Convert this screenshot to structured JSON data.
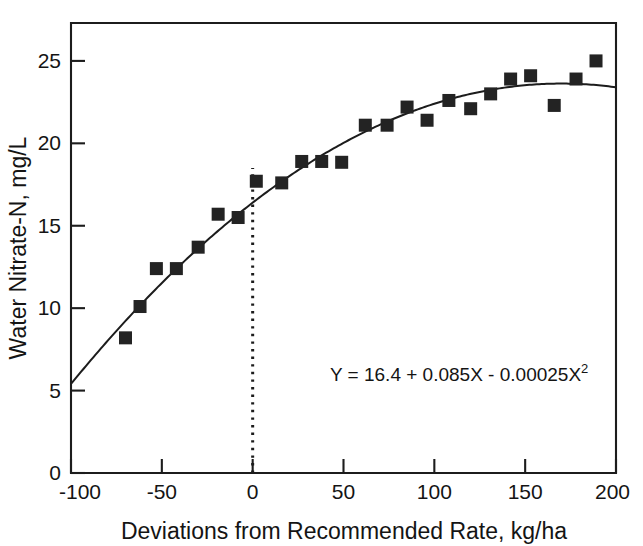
{
  "chart_data": {
    "type": "scatter",
    "title": "",
    "xlabel": "Deviations from Recommended Rate, kg/ha",
    "ylabel": "Water Nitrate-N, mg/L",
    "xlim": [
      -100,
      200
    ],
    "ylim": [
      0,
      27.3
    ],
    "xticks": [
      -100,
      -50,
      0,
      50,
      100,
      150,
      200
    ],
    "yticks": [
      0,
      5,
      10,
      15,
      20,
      25
    ],
    "xtick_labels": [
      "-100",
      "-50",
      "0",
      "50",
      "100",
      "150",
      "200"
    ],
    "ytick_labels": [
      "0",
      "5",
      "10",
      "15",
      "20",
      "25"
    ],
    "grid": false,
    "legend": "none",
    "marker_style": "filled-square",
    "marker_color": "#232323",
    "curve_color": "#1c1c1c",
    "annotations": [
      {
        "name": "regression-equation",
        "text": "Y = 16.4 + 0.085X - 0.00025X",
        "superscript": "2",
        "x": 58,
        "y": 7.2
      }
    ],
    "reference_line": {
      "name": "zero-deviation-line",
      "orientation": "vertical",
      "x": 0,
      "style": "dotted",
      "y_from": 0,
      "y_to": 18.5
    },
    "fit": {
      "equation": "Y = 16.4 + 0.085X - 0.00025X^2",
      "intercept": 16.4,
      "linear_coef": 0.085,
      "quadratic_coef": -0.00025,
      "x_from": -100,
      "x_to": 200
    },
    "x": [
      -70,
      -62,
      -53,
      -42,
      -30,
      -19,
      -8,
      2,
      16,
      27,
      38,
      49,
      62,
      74,
      85,
      96,
      108,
      120,
      131,
      142,
      153,
      166,
      178,
      189
    ],
    "y": [
      8.2,
      10.1,
      12.4,
      12.4,
      13.7,
      15.7,
      15.5,
      17.7,
      17.6,
      18.9,
      18.9,
      18.85,
      21.1,
      21.1,
      22.2,
      21.4,
      22.6,
      22.1,
      23.0,
      23.9,
      24.1,
      22.3,
      23.9,
      25.0
    ],
    "points": [
      {
        "x": -70,
        "y": 8.2
      },
      {
        "x": -62,
        "y": 10.1
      },
      {
        "x": -53,
        "y": 12.4
      },
      {
        "x": -42,
        "y": 12.4
      },
      {
        "x": -30,
        "y": 13.7
      },
      {
        "x": -19,
        "y": 15.7
      },
      {
        "x": -8,
        "y": 15.5
      },
      {
        "x": 2,
        "y": 17.7
      },
      {
        "x": 16,
        "y": 17.6
      },
      {
        "x": 27,
        "y": 18.9
      },
      {
        "x": 38,
        "y": 18.9
      },
      {
        "x": 49,
        "y": 18.85
      },
      {
        "x": 62,
        "y": 21.1
      },
      {
        "x": 74,
        "y": 21.1
      },
      {
        "x": 85,
        "y": 22.2
      },
      {
        "x": 96,
        "y": 21.4
      },
      {
        "x": 108,
        "y": 22.6
      },
      {
        "x": 120,
        "y": 22.1
      },
      {
        "x": 131,
        "y": 23.0
      },
      {
        "x": 142,
        "y": 23.9
      },
      {
        "x": 153,
        "y": 24.1
      },
      {
        "x": 166,
        "y": 22.3
      },
      {
        "x": 178,
        "y": 23.9
      },
      {
        "x": 189,
        "y": 25.0
      }
    ]
  }
}
